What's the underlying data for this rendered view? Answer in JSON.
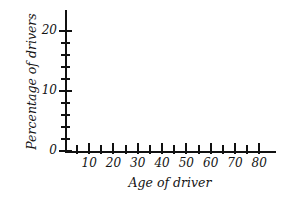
{
  "chart_data": {
    "type": "line",
    "title": "",
    "subtitle": "",
    "xlabel": "Age of driver",
    "ylabel": "Percentage of drivers",
    "series": [],
    "x": [],
    "values": [],
    "xlim": [
      0,
      85
    ],
    "ylim": [
      0,
      22
    ],
    "x_ticks": [
      5,
      10,
      15,
      20,
      25,
      30,
      35,
      40,
      45,
      50,
      55,
      60,
      65,
      70,
      75,
      80
    ],
    "x_tick_labels": [
      "",
      "10",
      "",
      "20",
      "",
      "30",
      "",
      "40",
      "",
      "50",
      "",
      "60",
      "",
      "70",
      "",
      "80"
    ],
    "x_tick_interval": 5,
    "x_labeled_interval": 10,
    "y_ticks": [
      0,
      2,
      4,
      6,
      8,
      10,
      12,
      14,
      16,
      18,
      20
    ],
    "y_tick_labels": [
      "0",
      "",
      "",
      "",
      "",
      "10",
      "",
      "",
      "",
      "",
      "20"
    ],
    "y_tick_interval": 2,
    "y_labeled_interval": 10,
    "grid": false,
    "legend": false,
    "legend_position": "none",
    "annotations": [],
    "note": "Empty axes template: no data plotted",
    "colors": {
      "axis": "#111111",
      "text": "#151515",
      "background": "#ffffff"
    }
  },
  "axes": {
    "y": {
      "label": "Percentage of drivers",
      "ticks": [
        {
          "value": 20,
          "label": "20",
          "major": true
        },
        {
          "value": 18,
          "label": "",
          "major": false
        },
        {
          "value": 16,
          "label": "",
          "major": false
        },
        {
          "value": 14,
          "label": "",
          "major": false
        },
        {
          "value": 12,
          "label": "",
          "major": false
        },
        {
          "value": 10,
          "label": "10",
          "major": true
        },
        {
          "value": 8,
          "label": "",
          "major": false
        },
        {
          "value": 6,
          "label": "",
          "major": false
        },
        {
          "value": 4,
          "label": "",
          "major": false
        },
        {
          "value": 2,
          "label": "",
          "major": false
        },
        {
          "value": 0,
          "label": "0",
          "major": true
        }
      ]
    },
    "x": {
      "label": "Age of driver",
      "ticks": [
        {
          "value": 5,
          "label": "",
          "major": false
        },
        {
          "value": 10,
          "label": "10",
          "major": true
        },
        {
          "value": 15,
          "label": "",
          "major": false
        },
        {
          "value": 20,
          "label": "20",
          "major": true
        },
        {
          "value": 25,
          "label": "",
          "major": false
        },
        {
          "value": 30,
          "label": "30",
          "major": true
        },
        {
          "value": 35,
          "label": "",
          "major": false
        },
        {
          "value": 40,
          "label": "40",
          "major": true
        },
        {
          "value": 45,
          "label": "",
          "major": false
        },
        {
          "value": 50,
          "label": "50",
          "major": true
        },
        {
          "value": 55,
          "label": "",
          "major": false
        },
        {
          "value": 60,
          "label": "60",
          "major": true
        },
        {
          "value": 65,
          "label": "",
          "major": false
        },
        {
          "value": 70,
          "label": "70",
          "major": true
        },
        {
          "value": 75,
          "label": "",
          "major": false
        },
        {
          "value": 80,
          "label": "80",
          "major": true
        }
      ]
    }
  }
}
